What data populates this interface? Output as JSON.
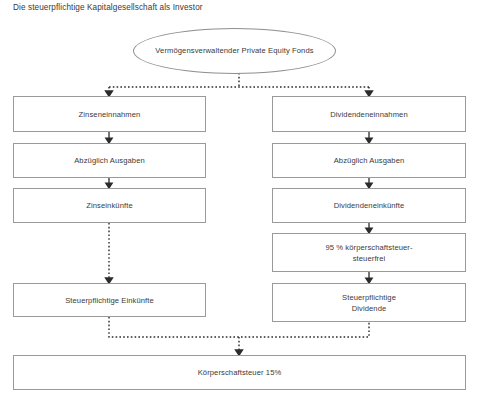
{
  "diagram": {
    "title": "Die steuerpflichtige Kapitalgesellschaft als Investor",
    "source_node": {
      "line1": "Vermögensverwaltender",
      "line2": "Private Equity Fonds"
    },
    "left_column": {
      "name": "Zinsen",
      "nodes": [
        {
          "label": "Zinseneinnahmen"
        },
        {
          "label": "Abzüglich Ausgaben"
        },
        {
          "label": "Zinseinkünfte"
        },
        {
          "label": "Steuerpflichtige Einkünfte"
        }
      ]
    },
    "right_column": {
      "name": "Dividenden",
      "nodes": [
        {
          "label": "Dividendeneinnahmen"
        },
        {
          "label": "Abzüglich Ausgaben"
        },
        {
          "label": "Dividendeneinkünfte"
        },
        {
          "line1": "95 % körperschaftsteuer-",
          "line2": "steuerfrei"
        },
        {
          "line1": "Steuerpflichtige",
          "line2": "Dividende"
        }
      ]
    },
    "result_node": {
      "label": "Körperschaftsteuer 15%"
    },
    "footer_text": "",
    "colors": {
      "border": "#9a9a9a",
      "text": "#3a3a3a",
      "connector": "#2b2b2b",
      "background": "#ffffff"
    }
  }
}
